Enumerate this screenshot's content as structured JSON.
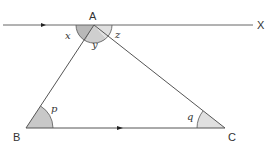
{
  "diagram": {
    "type": "geometry",
    "vertices": {
      "A": {
        "label": "A",
        "x": 94,
        "y": 25
      },
      "B": {
        "label": "B",
        "x": 26,
        "y": 128
      },
      "C": {
        "label": "C",
        "x": 225,
        "y": 128
      },
      "X": {
        "label": "X",
        "x": 255,
        "y": 25
      }
    },
    "angles": {
      "x": {
        "label": "x"
      },
      "y": {
        "label": "y"
      },
      "z": {
        "label": "z"
      },
      "p": {
        "label": "p"
      },
      "q": {
        "label": "q"
      }
    },
    "colors": {
      "line": "#555555",
      "shade_dark": "#b0b0b0",
      "shade_light": "#d8d8d8"
    }
  }
}
